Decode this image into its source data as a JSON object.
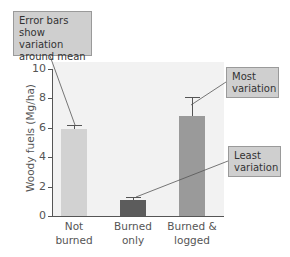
{
  "chart_data": {
    "type": "bar",
    "title": "",
    "xlabel": "",
    "ylabel": "Woody fuels (Mg/ha)",
    "ylim": [
      0,
      10
    ],
    "yticks": [
      0,
      2,
      4,
      6,
      8,
      10
    ],
    "categories": [
      "Not burned",
      "Burned only",
      "Burned & logged"
    ],
    "category_lines": [
      [
        "Not",
        "burned"
      ],
      [
        "Burned",
        "only"
      ],
      [
        "Burned &",
        "logged"
      ]
    ],
    "values": [
      5.9,
      1.1,
      6.8
    ],
    "error_upper": [
      6.2,
      1.3,
      8.1
    ],
    "bar_colors": [
      "#d2d2d2",
      "#5c5c5c",
      "#9a9a9a"
    ],
    "grid": false,
    "legend": null,
    "annotations": [
      {
        "text": "Error bars show variation around mean",
        "lines": [
          "Error bars",
          "show variation",
          "around mean"
        ],
        "points_to": "Not burned error bar"
      },
      {
        "text": "Most variation",
        "lines": [
          "Most",
          "variation"
        ],
        "points_to": "Burned & logged error bar"
      },
      {
        "text": "Least variation",
        "lines": [
          "Least",
          "variation"
        ],
        "points_to": "Burned only error bar"
      }
    ]
  },
  "callouts": {
    "error_bars": "Error bars show variation around mean",
    "most": "Most variation",
    "least": "Least variation"
  }
}
